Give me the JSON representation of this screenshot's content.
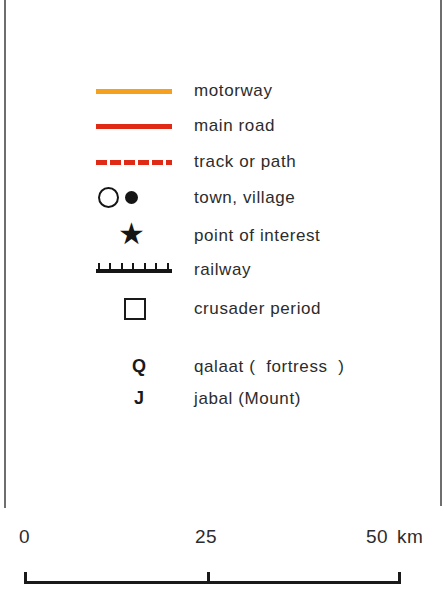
{
  "legend": {
    "items": [
      {
        "symbol": "orange-solid-line",
        "color": "#f5a01e",
        "label": "motorway"
      },
      {
        "symbol": "red-solid-line",
        "color": "#e02a16",
        "label": "main road"
      },
      {
        "symbol": "red-dashed-line",
        "color": "#e02a16",
        "label": "track or path"
      },
      {
        "symbol": "open-and-filled-circle",
        "label": "town, village"
      },
      {
        "symbol": "star",
        "glyph": "★",
        "label": "point of interest"
      },
      {
        "symbol": "railway-line",
        "label": "railway"
      },
      {
        "symbol": "open-square",
        "label": "crusader period"
      },
      {
        "symbol": "letter-q",
        "glyph": "Q",
        "label": "qalaat (  fortress  )"
      },
      {
        "symbol": "letter-j",
        "glyph": "J",
        "label": "jabal (Mount)"
      }
    ]
  },
  "scale": {
    "ticks": [
      "0",
      "25",
      "50"
    ],
    "unit": "km"
  }
}
